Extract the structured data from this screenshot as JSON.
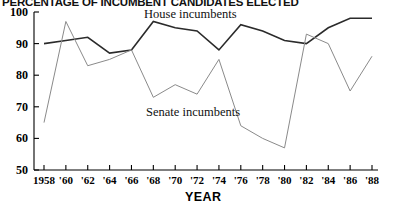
{
  "chart_data": {
    "type": "line",
    "title": "PERCENTAGE OF INCUMBENT CANDIDATES ELECTED",
    "xlabel": "YEAR",
    "ylabel": "",
    "grid": false,
    "legend_position": "inline-annotations",
    "xlim": [
      1958,
      1988
    ],
    "ylim": [
      50,
      100
    ],
    "ytick_values": [
      100,
      90,
      80,
      70,
      60,
      50
    ],
    "ytick_labels": [
      "100",
      "90",
      "80",
      "70",
      "60",
      "50"
    ],
    "x": [
      1958,
      1960,
      1962,
      1964,
      1966,
      1968,
      1970,
      1972,
      1974,
      1976,
      1978,
      1980,
      1982,
      1984,
      1986,
      1988
    ],
    "xtick_labels": [
      "1958",
      "'60",
      "'62",
      "'64",
      "'66",
      "'68",
      "'70",
      "'72",
      "'74",
      "'76",
      "'78",
      "'80",
      "'82",
      "'84",
      "'86",
      "'88"
    ],
    "series": [
      {
        "name": "House incumbents",
        "color": "#2b2b2b",
        "width": 1.6,
        "values": [
          90,
          91,
          92,
          87,
          88,
          97,
          95,
          94,
          88,
          96,
          94,
          91,
          90,
          95,
          98,
          98
        ]
      },
      {
        "name": "Senate incumbents",
        "color": "#8a8a8a",
        "width": 1.0,
        "values": [
          65,
          97,
          83,
          85,
          88,
          73,
          77,
          74,
          85,
          64,
          60,
          57,
          93,
          90,
          75,
          86
        ]
      }
    ],
    "annotations": [
      {
        "text": "House incumbents",
        "x": 1970,
        "y": 101
      },
      {
        "text": "Senate incumbents",
        "x": 1970,
        "y": 67
      }
    ]
  }
}
